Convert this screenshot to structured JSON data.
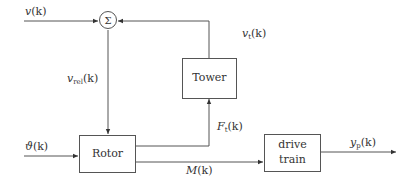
{
  "blocks": {
    "sum": {
      "symbol": "Σ"
    },
    "tower": {
      "label": "Tower"
    },
    "rotor": {
      "label": "Rotor"
    },
    "drive_train": {
      "line1": "drive",
      "line2": "train"
    }
  },
  "signals": {
    "v": {
      "name": "v",
      "arg": "(k)"
    },
    "v_t": {
      "name": "v",
      "sub": "t",
      "arg": "(k)"
    },
    "v_rel": {
      "name": "v",
      "sub": "rel",
      "arg": "(k)"
    },
    "theta": {
      "name": "ϑ",
      "arg": "(k)"
    },
    "F_t": {
      "name": "F",
      "sub": "t",
      "arg": "(k)"
    },
    "M": {
      "name": "M",
      "arg": "(k)"
    },
    "y_p": {
      "name": "y",
      "sub": "p",
      "arg": "(k)"
    }
  },
  "colors": {
    "line": "#555555",
    "text": "#333333"
  }
}
